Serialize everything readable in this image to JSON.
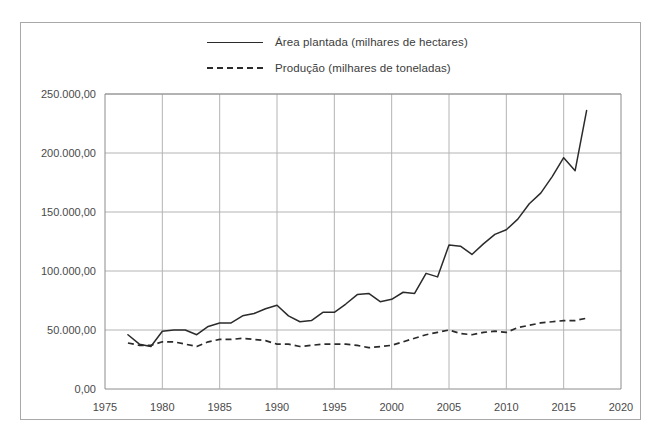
{
  "chart_data": {
    "type": "line",
    "title": "",
    "subtitle": "",
    "xlabel": "",
    "ylabel": "",
    "xlim": [
      1975,
      2020
    ],
    "ylim": [
      0,
      250000
    ],
    "grid": true,
    "legend_position": "top",
    "xticks": [
      "1975",
      "1980",
      "1985",
      "1990",
      "1995",
      "2000",
      "2005",
      "2010",
      "2015",
      "2020"
    ],
    "xtick_values": [
      1975,
      1980,
      1985,
      1990,
      1995,
      2000,
      2005,
      2010,
      2015,
      2020
    ],
    "yticks": [
      "0,00",
      "50.000,00",
      "100.000,00",
      "150.000,00",
      "200.000,00",
      "250.000,00"
    ],
    "ytick_values": [
      0,
      50000,
      100000,
      150000,
      200000,
      250000
    ],
    "x": [
      1977,
      1978,
      1979,
      1980,
      1981,
      1982,
      1983,
      1984,
      1985,
      1986,
      1987,
      1988,
      1989,
      1990,
      1991,
      1992,
      1993,
      1994,
      1995,
      1996,
      1997,
      1998,
      1999,
      2000,
      2001,
      2002,
      2003,
      2004,
      2005,
      2006,
      2007,
      2008,
      2009,
      2010,
      2011,
      2012,
      2013,
      2014,
      2015,
      2016,
      2017
    ],
    "series": [
      {
        "name": "Área plantada (milhares de hectares)",
        "style": "solid",
        "values": [
          46000,
          38000,
          36000,
          49000,
          50000,
          50000,
          46000,
          53000,
          56000,
          56000,
          62000,
          64000,
          68000,
          71000,
          62000,
          57000,
          58000,
          65000,
          65000,
          72000,
          80000,
          81000,
          74000,
          76000,
          82000,
          81000,
          98000,
          95000,
          122000,
          121000,
          114000,
          123000,
          131000,
          135000,
          144000,
          157000,
          166000,
          180000,
          196000,
          185000,
          236000
        ]
      },
      {
        "name": "Produção (milhares de toneladas)",
        "style": "dashed",
        "values": [
          39000,
          37000,
          37000,
          40000,
          40000,
          38000,
          36000,
          40000,
          42000,
          42000,
          43000,
          42000,
          41000,
          38000,
          38000,
          36000,
          37000,
          38000,
          38000,
          38000,
          37000,
          35000,
          36000,
          37000,
          40000,
          43000,
          46000,
          48000,
          50000,
          47000,
          46000,
          48000,
          49000,
          48000,
          52000,
          54000,
          56000,
          57000,
          58000,
          58000,
          60000
        ]
      }
    ]
  },
  "legend": {
    "items": [
      {
        "label": "Área plantada (milhares de hectares)",
        "style": "solid"
      },
      {
        "label": "Produção (milhares de toneladas)",
        "style": "dashed"
      }
    ]
  }
}
